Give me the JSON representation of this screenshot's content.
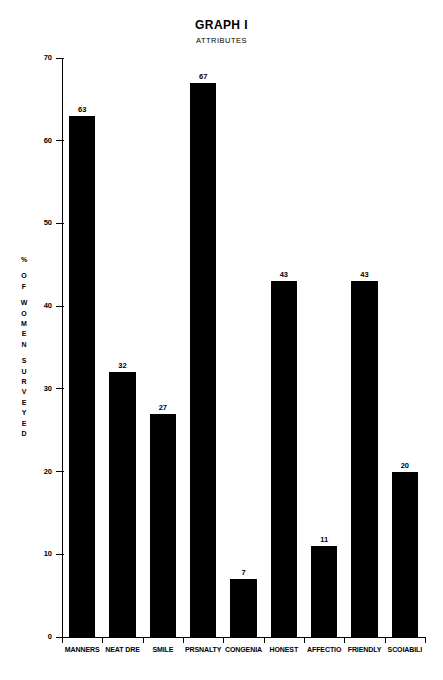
{
  "chart_data": {
    "type": "bar",
    "title": "GRAPH I",
    "subtitle": "ATTRIBUTES",
    "xlabel": "",
    "ylabel": "% OF WOMEN SURVEYED",
    "ylim": [
      0,
      70
    ],
    "ytick_step": 10,
    "grid": false,
    "legend": "none",
    "bar_color": "#000000",
    "categories": [
      "MANNERS",
      "NEAT DRE",
      "SMILE",
      "PRSNALTY",
      "CONGENIA",
      "HONEST",
      "AFFECTIO",
      "FRIENDLY",
      "SCOIABILI"
    ],
    "values": [
      63,
      32,
      27,
      67,
      7,
      43,
      11,
      43,
      20
    ],
    "ytick_labels": [
      "0",
      "10",
      "20",
      "30",
      "40",
      "50",
      "60",
      "70"
    ]
  },
  "y_axis_letters": [
    "%",
    "",
    "O",
    "F",
    "",
    "W",
    "O",
    "M",
    "E",
    "N",
    "",
    "S",
    "U",
    "R",
    "V",
    "E",
    "Y",
    "E",
    "D"
  ]
}
